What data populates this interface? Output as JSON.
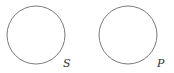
{
  "diagram": {
    "circles": [
      {
        "label": "S",
        "cx": 36,
        "cy": 35,
        "r": 29
      },
      {
        "label": "P",
        "cx": 128,
        "cy": 35,
        "r": 29
      }
    ],
    "stroke_color": "#7a7a7a",
    "label_color": "#333333"
  }
}
